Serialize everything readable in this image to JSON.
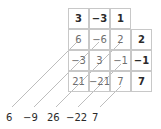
{
  "diagram": {
    "type": "polynomial multiplication grid (box method)",
    "top_row": [
      "3",
      "−3",
      "1"
    ],
    "right_column": [
      "2",
      "−1",
      "7"
    ],
    "products": [
      [
        "6",
        "−6",
        "2"
      ],
      [
        "−3",
        "3",
        "−1"
      ],
      [
        "21",
        "−21",
        "7"
      ]
    ],
    "diagonal_sums": [
      "6",
      "−9",
      "26",
      "−22",
      "7"
    ]
  }
}
